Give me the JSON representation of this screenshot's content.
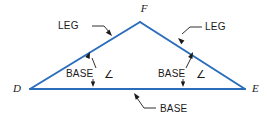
{
  "figure": {
    "type": "geometry-diagram",
    "background_color": "#ffffff",
    "triangle_stroke_color": "#2a6ebb",
    "leader_stroke_color": "#1a1a1a",
    "text_color": "#1a1a1a"
  },
  "vertices": {
    "apex": {
      "label": "F",
      "x": 140,
      "y": 22
    },
    "left": {
      "label": "D",
      "x": 30,
      "y": 89
    },
    "right": {
      "label": "E",
      "x": 245,
      "y": 89
    }
  },
  "vertex_labels": [
    {
      "name": "vertex-label-f",
      "text": "F",
      "x": 144,
      "y": 12
    },
    {
      "name": "vertex-label-d",
      "text": "D",
      "x": 13,
      "y": 92
    },
    {
      "name": "vertex-label-e",
      "text": "E",
      "x": 252,
      "y": 92
    }
  ],
  "callouts": [
    {
      "name": "leg-left",
      "text": "LEG",
      "text_x": 58,
      "text_y": 29,
      "leader": "M 92 26 L 104 26 L 110 33",
      "arrow_tip": {
        "x": 112,
        "y": 36
      },
      "arrow_angle": 48
    },
    {
      "name": "leg-right",
      "text": "LEG",
      "text_x": 205,
      "text_y": 30,
      "leader": "M 202 27 L 190 27 L 182 34",
      "arrow_tip": {
        "x": 178,
        "y": 38
      },
      "arrow_angle": 222
    },
    {
      "name": "base-angle-left",
      "text": "BASE",
      "glyph": "∠",
      "text_x": 66,
      "text_y": 77,
      "glyph_x": 104,
      "glyph_y": 78,
      "leader": "M 96 68 L 92 58",
      "arrow_tip": {
        "x": 90,
        "y": 52
      },
      "arrow_angle": -67
    },
    {
      "name": "base-angle-right",
      "text": "BASE",
      "glyph": "∠",
      "text_x": 158,
      "text_y": 77,
      "glyph_x": 196,
      "glyph_y": 78,
      "leader": "M 186 68 L 191 58",
      "arrow_tip": {
        "x": 193,
        "y": 52
      },
      "arrow_angle": -65
    },
    {
      "name": "base-bottom",
      "text": "BASE",
      "text_x": 160,
      "text_y": 112,
      "leader": "M 156 108 L 144 108 L 137 98",
      "arrow_tip": {
        "x": 134,
        "y": 93
      },
      "arrow_angle": -125
    }
  ],
  "tick_arrows": [
    {
      "name": "base-angle-left-down-arrow",
      "x": 93,
      "y": 86,
      "angle": 90
    },
    {
      "name": "base-angle-right-down-arrow",
      "x": 183,
      "y": 86,
      "angle": 90
    }
  ],
  "legend_terms": {
    "leg": "LEG",
    "base": "BASE",
    "base_angle": "BASE ∠"
  }
}
